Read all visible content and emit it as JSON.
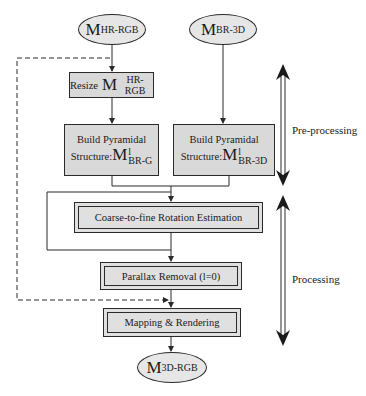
{
  "diagram": {
    "inputs": {
      "hr_rgb": {
        "symbol": "M",
        "subscript": "HR-RGB"
      },
      "br_3d": {
        "symbol": "M",
        "subscript": "BR-3D"
      }
    },
    "nodes": {
      "resize": {
        "prefix": "Resize",
        "symbol": "M",
        "subscript": "HR-RGB"
      },
      "pyramid_left": {
        "line1": "Build Pyramidal",
        "prefix": "Structure:",
        "symbol": "M",
        "superscript": "l",
        "subscript": "BR-G"
      },
      "pyramid_right": {
        "line1": "Build Pyramidal",
        "prefix": "Structure:",
        "symbol": "M",
        "superscript": "l",
        "subscript": "BR-3D"
      },
      "rotation": {
        "label": "Coarse-to-fine Rotation Estimation"
      },
      "parallax": {
        "label": "Parallax Removal (l=0)"
      },
      "mapping": {
        "label": "Mapping & Rendering"
      }
    },
    "output": {
      "symbol": "M",
      "subscript": "3D-RGB"
    },
    "stages": {
      "preprocessing": "Pre-processing",
      "processing": "Processing"
    },
    "colors": {
      "box_fill": "#d9d9d9",
      "ellipse_fill": "#e6e6e6",
      "stroke": "#2a2a2a"
    }
  }
}
